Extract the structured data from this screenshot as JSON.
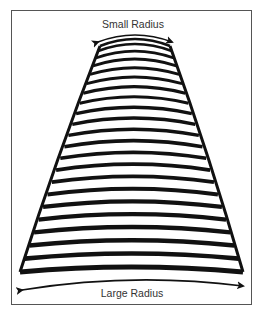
{
  "labels": {
    "top": "Small Radius",
    "bottom": "Large Radius"
  },
  "colors": {
    "ink": "#111111",
    "frame": "#555555",
    "background": "#ffffff"
  },
  "cone": {
    "top": {
      "y": 46,
      "left": 100,
      "right": 170
    },
    "bottom": {
      "y": 272,
      "left": 20,
      "right": 243
    },
    "band_count": 22
  }
}
